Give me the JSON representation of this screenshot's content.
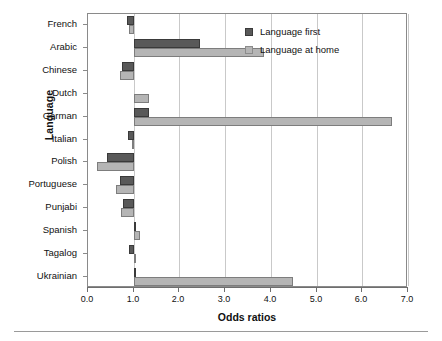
{
  "chart_data": {
    "type": "bar",
    "orientation": "horizontal",
    "title": "",
    "xlabel": "Odds ratios",
    "ylabel": "Language",
    "xlim": [
      0.0,
      7.0
    ],
    "xticks": [
      "0.0",
      "1.0",
      "2.0",
      "3.0",
      "4.0",
      "5.0",
      "6.0",
      "7.0"
    ],
    "xtick_values": [
      0,
      1,
      2,
      3,
      4,
      5,
      6,
      7
    ],
    "grid": "vertical gridlines at each integer tick",
    "reference_line": 1.0,
    "legend_position": "top-right inside plot",
    "categories": [
      "French",
      "Arabic",
      "Chinese",
      "Dutch",
      "German",
      "Italian",
      "Polish",
      "Portuguese",
      "Punjabi",
      "Spanish",
      "Tagalog",
      "Ukrainian"
    ],
    "series": [
      {
        "name": "Language first",
        "color": "#595959",
        "values": [
          0.86,
          2.44,
          0.74,
          null,
          1.33,
          0.88,
          0.42,
          0.7,
          0.76,
          1.06,
          0.9,
          1.02
        ]
      },
      {
        "name": "Language at home",
        "color": "#b5b5b5",
        "values": [
          0.9,
          3.85,
          0.7,
          1.33,
          6.65,
          0.96,
          0.19,
          0.62,
          0.72,
          1.14,
          1.03,
          4.48
        ]
      }
    ]
  },
  "legend": {
    "items": [
      {
        "label": "Language first",
        "color": "#595959"
      },
      {
        "label": "Language at home",
        "color": "#b5b5b5"
      }
    ]
  },
  "axes": {
    "x_title": "Odds ratios",
    "y_title": "Language"
  }
}
